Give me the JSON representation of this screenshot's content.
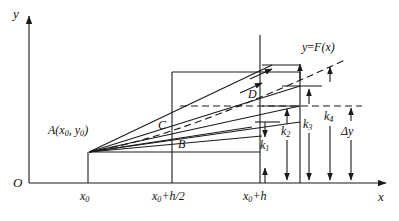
{
  "figure": {
    "type": "math-diagram",
    "axes": {
      "y_label": "y",
      "x_label": "x",
      "origin_label": "O",
      "x_ticks": [
        {
          "label_main": "x",
          "label_sub": "0",
          "label_tail": "",
          "x": 88
        },
        {
          "label_main": "x",
          "label_sub": "0",
          "label_tail": "+h/2",
          "x": 172
        },
        {
          "label_main": "x",
          "label_sub": "0",
          "label_tail": "+h",
          "x": 260
        }
      ]
    },
    "points": [
      {
        "name": "A",
        "label_main": "A(x",
        "label_sub1": "0",
        "label_mid": ", y",
        "label_sub2": "0",
        "label_tail": ")",
        "x": 89,
        "y": 152
      },
      {
        "name": "B",
        "label": "B",
        "x": 182,
        "y": 145
      },
      {
        "name": "C",
        "label": "C",
        "x": 162,
        "y": 126
      },
      {
        "name": "D",
        "label": "D",
        "x": 252,
        "y": 95
      }
    ],
    "curve_label": {
      "main": "y",
      "eq": "=",
      "fn": "F(x)"
    },
    "increments": [
      {
        "name": "k1",
        "label_main": "k",
        "label_sub": "1",
        "x": 268,
        "y": 145
      },
      {
        "name": "k2",
        "label_main": "k",
        "label_sub": "2",
        "x": 288,
        "y": 131
      },
      {
        "name": "k3",
        "label_main": "k",
        "label_sub": "3",
        "x": 310,
        "y": 124
      },
      {
        "name": "k4",
        "label_main": "k",
        "label_sub": "4",
        "x": 330,
        "y": 117
      },
      {
        "name": "dy",
        "label_main": "Δy",
        "label_sub": "",
        "x": 352,
        "y": 131
      }
    ],
    "colors": {
      "ink": "#1a1a1a",
      "paper": "#ffffff"
    }
  }
}
